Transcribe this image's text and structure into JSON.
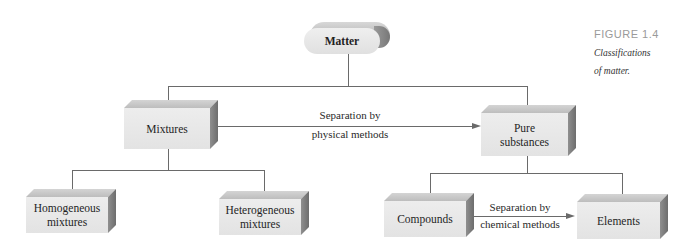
{
  "caption": {
    "figure_label": "FIGURE 1.4",
    "text_line1": "Classifications",
    "text_line2": "of matter."
  },
  "nodes": {
    "matter": "Matter",
    "mixtures": "Mixtures",
    "pure_substances_line1": "Pure",
    "pure_substances_line2": "substances",
    "homogeneous_line1": "Homogeneous",
    "homogeneous_line2": "mixtures",
    "heterogeneous_line1": "Heterogeneous",
    "heterogeneous_line2": "mixtures",
    "compounds": "Compounds",
    "elements": "Elements"
  },
  "edges": {
    "physical": {
      "line1": "Separation by",
      "line2": "physical methods"
    },
    "chemical": {
      "line1": "Separation by",
      "line2": "chemical methods"
    }
  },
  "colors": {
    "box_front": "#e6e6e6",
    "box_top": "#c4c4c4",
    "box_side": "#7d7d7d",
    "line": "#6a6a6a",
    "caption_label": "#9a9a9a"
  }
}
